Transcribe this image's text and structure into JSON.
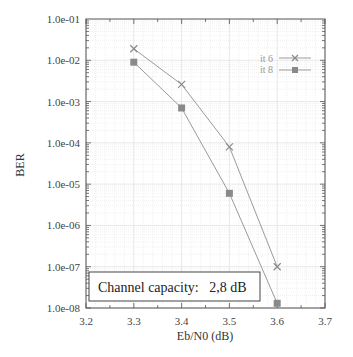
{
  "chart_data": {
    "type": "line",
    "title": "",
    "xlabel": "Eb/N0 (dB)",
    "ylabel": "BER",
    "xlim": [
      3.2,
      3.7
    ],
    "ylim": [
      1e-08,
      0.1
    ],
    "yscale": "log",
    "grid": true,
    "x_ticks": [
      "3.2",
      "3.3",
      "3.4",
      "3.5",
      "3.6",
      "3.7"
    ],
    "y_ticks": [
      "1.0e-01",
      "1.0e-02",
      "1.0e-03",
      "1.0e-04",
      "1.0e-05",
      "1.0e-06",
      "1.0e-07",
      "1.0e-08"
    ],
    "legend_position": "upper right",
    "series": [
      {
        "name": "it 6",
        "marker": "x",
        "x": [
          3.3,
          3.4,
          3.5,
          3.6
        ],
        "values": [
          0.019,
          0.0026,
          8e-05,
          1e-07
        ]
      },
      {
        "name": "it 8",
        "marker": "square",
        "x": [
          3.3,
          3.4,
          3.5,
          3.6
        ],
        "values": [
          0.009,
          0.0007,
          6e-06,
          1.3e-08
        ]
      }
    ],
    "annotations": [
      {
        "text": "Channel capacity:   2,8 dB",
        "position": "lower left, boxed"
      }
    ]
  },
  "labels": {
    "xlabel": "Eb/N0 (dB)",
    "ylabel": "BER",
    "annotation": "Channel capacity:   2,8 dB",
    "legend": [
      "it 6",
      "it 8"
    ]
  },
  "colors": {
    "line": "#9a9a9a",
    "marker": "#8a8a8a",
    "grid": "#e2e2e2",
    "axis": "#555555"
  }
}
